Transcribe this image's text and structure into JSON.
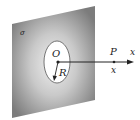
{
  "diagram": {
    "labels": {
      "sigma": "σ",
      "origin": "O",
      "radius": "R",
      "point": "P",
      "axis": "x",
      "distance": "x"
    },
    "colors": {
      "plane_edge": "#7a7a7a",
      "plane_center": "#e8e8e8",
      "hole": "#ffffff",
      "line": "#222222"
    }
  }
}
